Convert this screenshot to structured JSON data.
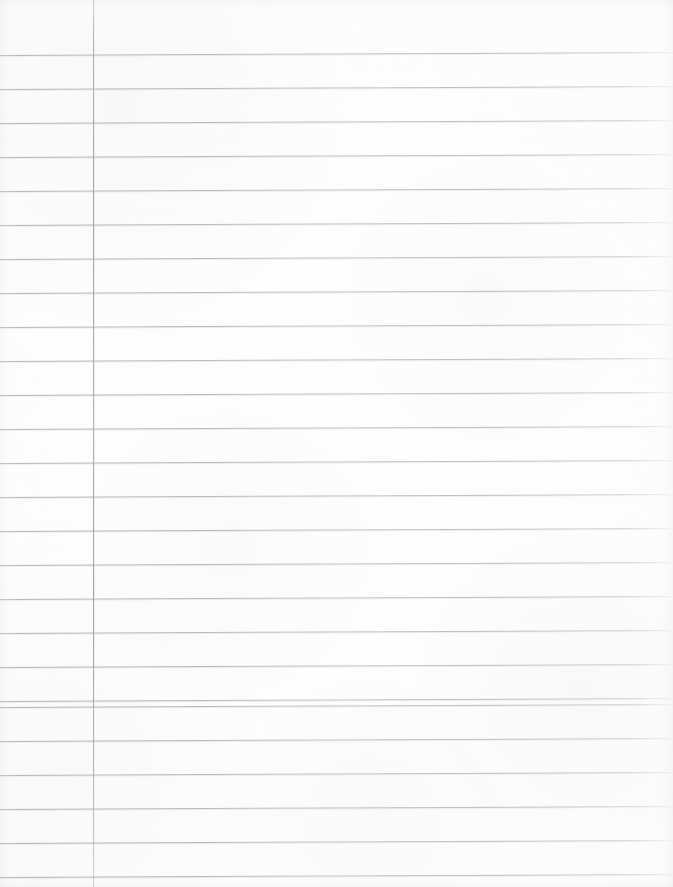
{
  "document": {
    "kind": "lined-notebook-paper",
    "content_text": "",
    "width": 673,
    "height": 887
  },
  "paper": {
    "background_color": "#fdfdfc",
    "texture": "subtle-scan-grain"
  },
  "ruling": {
    "rule_color": "#aab0b7",
    "rule_thickness_px": 1,
    "line_spacing_px": 34,
    "first_line_y": 55,
    "line_count": 25,
    "skew_degrees": -0.26,
    "line_y_positions": [
      55,
      89,
      123,
      157,
      191,
      225,
      259,
      293,
      327,
      361,
      395,
      429,
      463,
      497,
      531,
      565,
      599,
      633,
      667,
      701,
      707,
      741,
      775,
      809,
      843,
      877
    ]
  },
  "margin": {
    "margin_rule_color": "#9aa0a8",
    "margin_rule_x": 93,
    "margin_rule_thickness_px": 1
  }
}
